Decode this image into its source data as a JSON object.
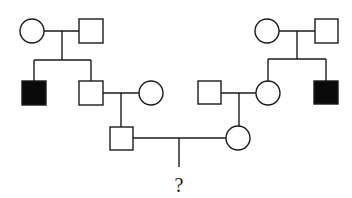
{
  "diagram": {
    "type": "pedigree-chart",
    "colors": {
      "line": "#1a1a1a",
      "affected": "#0a0a0a",
      "unaffected": "#ffffff",
      "background": "#ffffff"
    },
    "legend": {
      "square": "male",
      "circle": "female",
      "filled": "affected",
      "open": "unaffected"
    },
    "individuals": [
      {
        "id": "I-1",
        "generation": 1,
        "sex": "female",
        "affected": false,
        "side": "left"
      },
      {
        "id": "I-2",
        "generation": 1,
        "sex": "male",
        "affected": false,
        "side": "left"
      },
      {
        "id": "I-3",
        "generation": 1,
        "sex": "female",
        "affected": false,
        "side": "right"
      },
      {
        "id": "I-4",
        "generation": 1,
        "sex": "male",
        "affected": false,
        "side": "right"
      },
      {
        "id": "II-1",
        "generation": 2,
        "sex": "male",
        "affected": true,
        "parents": [
          "I-1",
          "I-2"
        ]
      },
      {
        "id": "II-2",
        "generation": 2,
        "sex": "male",
        "affected": false,
        "parents": [
          "I-1",
          "I-2"
        ]
      },
      {
        "id": "II-3",
        "generation": 2,
        "sex": "female",
        "affected": false,
        "spouse_of": "II-2"
      },
      {
        "id": "II-4",
        "generation": 2,
        "sex": "male",
        "affected": false,
        "spouse_of": "II-5"
      },
      {
        "id": "II-5",
        "generation": 2,
        "sex": "female",
        "affected": false,
        "parents": [
          "I-3",
          "I-4"
        ]
      },
      {
        "id": "II-6",
        "generation": 2,
        "sex": "male",
        "affected": true,
        "parents": [
          "I-3",
          "I-4"
        ]
      },
      {
        "id": "III-1",
        "generation": 3,
        "sex": "male",
        "affected": false,
        "parents": [
          "II-2",
          "II-3"
        ]
      },
      {
        "id": "III-2",
        "generation": 3,
        "sex": "female",
        "affected": false,
        "parents": [
          "II-4",
          "II-5"
        ]
      },
      {
        "id": "IV-1",
        "generation": 4,
        "sex": "unknown",
        "affected": null,
        "parents": [
          "III-1",
          "III-2"
        ],
        "label": "?"
      }
    ],
    "unknown_child_label": "?"
  }
}
